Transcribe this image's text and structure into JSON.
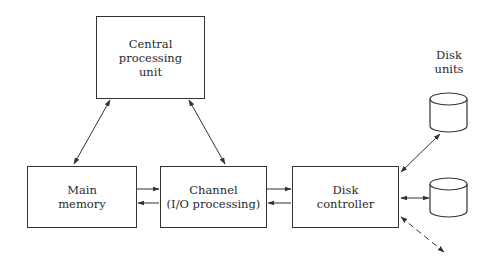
{
  "diagram": {
    "nodes": {
      "cpu": {
        "lines": [
          "Central",
          "processing",
          "unit"
        ]
      },
      "main_memory": {
        "lines": [
          "Main",
          "memory"
        ]
      },
      "channel": {
        "lines": [
          "Channel",
          "(I/O processing)"
        ]
      },
      "disk_controller": {
        "lines": [
          "Disk",
          "controller"
        ]
      },
      "disk_units": {
        "lines": [
          "Disk",
          "units"
        ]
      }
    },
    "edges": [
      {
        "from": "cpu",
        "to": "main_memory",
        "type": "bidirectional"
      },
      {
        "from": "cpu",
        "to": "channel",
        "type": "bidirectional"
      },
      {
        "from": "main_memory",
        "to": "channel",
        "type": "two one-way arrows"
      },
      {
        "from": "channel",
        "to": "disk_controller",
        "type": "two one-way arrows"
      },
      {
        "from": "disk_controller",
        "to": "disk_unit_1",
        "type": "bidirectional"
      },
      {
        "from": "disk_controller",
        "to": "disk_unit_2",
        "type": "bidirectional"
      },
      {
        "from": "disk_controller",
        "to": "additional_disk_units",
        "type": "dashed bidirectional"
      }
    ]
  }
}
